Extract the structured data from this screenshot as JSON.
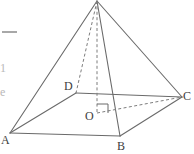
{
  "figure": {
    "kind": "geometry-diagram",
    "canvas": {
      "width": 194,
      "height": 154
    },
    "stroke_color": "#6a6a6a",
    "label_color": "#3d3d3d",
    "background": "#ffffff",
    "vertices": [
      {
        "id": "apex",
        "label": "",
        "x": 97,
        "y": 1
      },
      {
        "id": "A",
        "label": "A",
        "x": 10,
        "y": 133,
        "label_x": 1,
        "label_y": 134
      },
      {
        "id": "B",
        "label": "B",
        "x": 120,
        "y": 136,
        "label_x": 117,
        "label_y": 140
      },
      {
        "id": "C",
        "label": "C",
        "x": 182,
        "y": 97,
        "label_x": 183,
        "label_y": 90
      },
      {
        "id": "D",
        "label": "D",
        "x": 76,
        "y": 93,
        "label_x": 64,
        "label_y": 80
      },
      {
        "id": "O",
        "label": "O",
        "x": 97,
        "y": 113,
        "label_x": 85,
        "label_y": 110
      }
    ],
    "solid_edges": [
      {
        "name": "edge-apex-a",
        "from": "apex",
        "to": "A"
      },
      {
        "name": "edge-apex-b",
        "from": "apex",
        "to": "B"
      },
      {
        "name": "edge-apex-c",
        "from": "apex",
        "to": "C"
      },
      {
        "name": "edge-a-b",
        "from": "A",
        "to": "B"
      },
      {
        "name": "edge-b-c",
        "from": "B",
        "to": "C"
      },
      {
        "name": "edge-a-d",
        "from": "A",
        "to": "D"
      },
      {
        "name": "edge-d-c",
        "from": "D",
        "to": "C"
      }
    ],
    "dashed_edges": [
      {
        "name": "edge-apex-d",
        "from": "apex",
        "to": "D"
      },
      {
        "name": "altitude-apex-o",
        "from": "apex",
        "to": "O"
      },
      {
        "name": "edge-o-c",
        "from": "O",
        "to": "C"
      }
    ],
    "right_angle_marker": {
      "name": "right-angle-at-o",
      "at": "O",
      "points": "97,104 108,104 108,113"
    },
    "margin_marks": {
      "top_rule": {
        "x": 2,
        "y": 31,
        "width": 15,
        "height": 2
      },
      "glyphs": [
        {
          "text": "1",
          "x": 0,
          "y": 62
        },
        {
          "text": "e",
          "x": 0,
          "y": 86
        }
      ]
    }
  }
}
